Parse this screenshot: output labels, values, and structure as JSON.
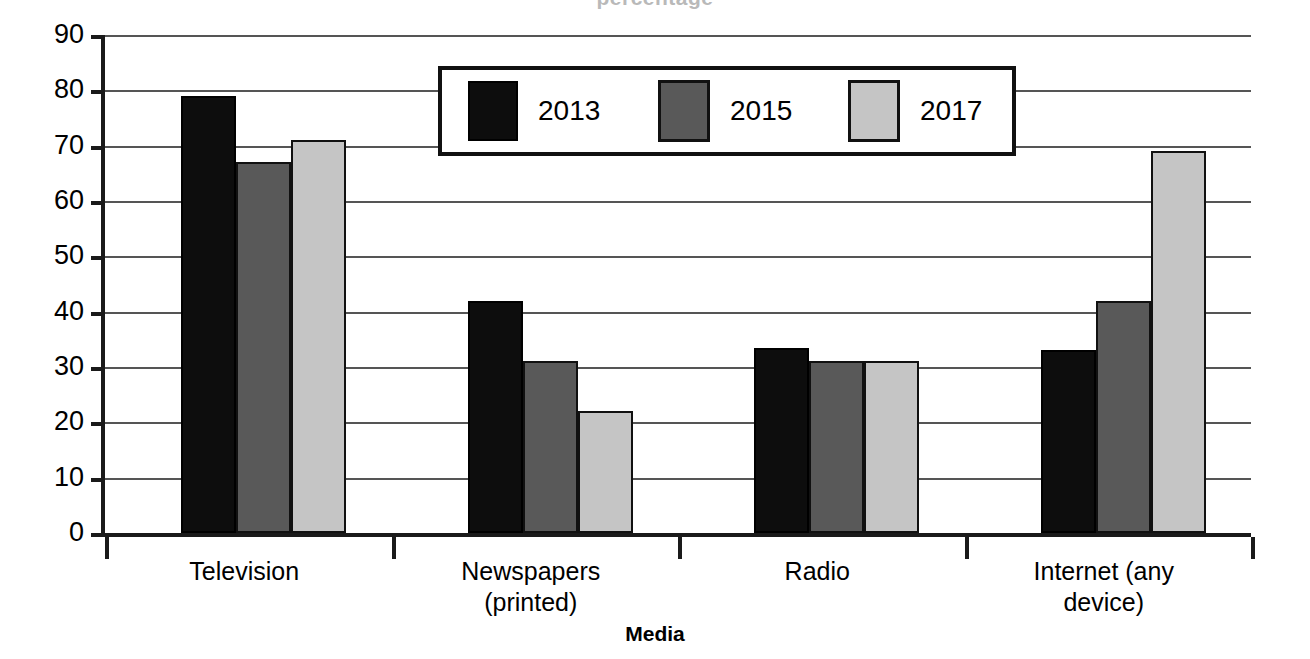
{
  "chart_data": {
    "type": "bar",
    "title": "",
    "xlabel": "Media",
    "ylabel": "Percentage of population",
    "ylim": [
      0,
      90
    ],
    "ytick_step": 10,
    "yticks": [
      90,
      80,
      70,
      60,
      50,
      40,
      30,
      20,
      10,
      0
    ],
    "grid": "horizontal",
    "legend_position": "top-center-inside",
    "categories": [
      "Television",
      "Newspapers\n(printed)",
      "Radio",
      "Internet (any\ndevice)"
    ],
    "series": [
      {
        "name": "2013",
        "color": "#0d0d0d",
        "values": [
          79,
          42,
          33.5,
          33
        ]
      },
      {
        "name": "2015",
        "color": "#595959",
        "values": [
          67,
          31,
          31,
          42
        ]
      },
      {
        "name": "2017",
        "color": "#c5c5c5",
        "values": [
          71,
          22,
          31,
          69
        ]
      }
    ]
  },
  "axes": {
    "y_title": "Percentage of population",
    "x_title": "Media",
    "y_tick_labels": [
      "90",
      "80",
      "70",
      "60",
      "50",
      "40",
      "30",
      "20",
      "10",
      "0"
    ],
    "x_tick_labels": [
      "Television",
      "Newspapers\n(printed)",
      "Radio",
      "Internet (any\ndevice)"
    ]
  },
  "legend": {
    "entries": [
      {
        "label": "2013",
        "color": "#0d0d0d"
      },
      {
        "label": "2015",
        "color": "#595959"
      },
      {
        "label": "2017",
        "color": "#c5c5c5"
      }
    ]
  },
  "title_sliver": {
    "text": "percentage"
  }
}
